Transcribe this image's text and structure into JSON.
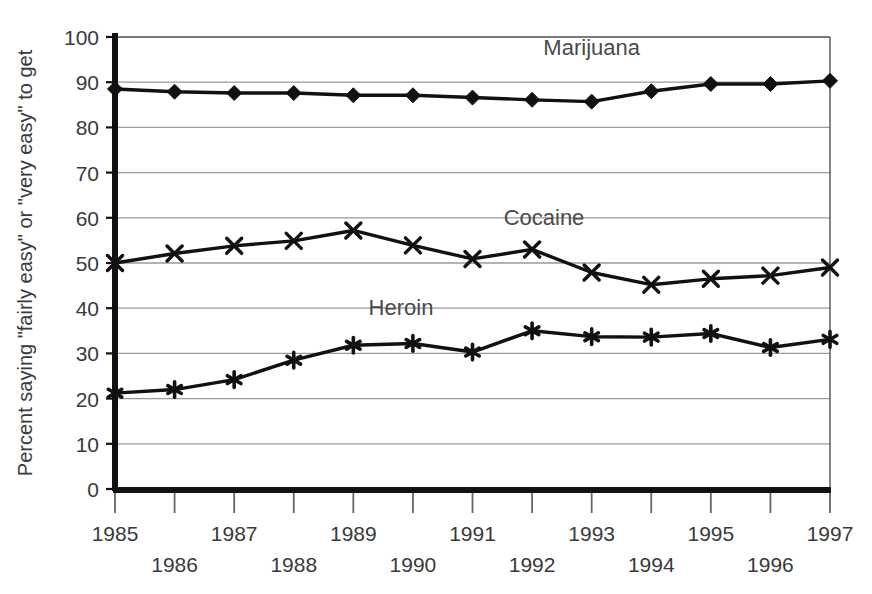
{
  "chart_data": {
    "type": "line",
    "title": "",
    "xlabel": "",
    "ylabel": "Percent saying \"fairly easy\" or \"very easy\" to get",
    "categories": [
      "1985",
      "1986",
      "1987",
      "1988",
      "1989",
      "1990",
      "1991",
      "1992",
      "1993",
      "1994",
      "1995",
      "1996",
      "1997"
    ],
    "x": [
      1985,
      1986,
      1987,
      1988,
      1989,
      1990,
      1991,
      1992,
      1993,
      1994,
      1995,
      1996,
      1997
    ],
    "xlim": [
      1985,
      1997
    ],
    "ylim": [
      0,
      100
    ],
    "ytick_values": [
      0,
      10,
      20,
      30,
      40,
      50,
      60,
      70,
      80,
      90,
      100
    ],
    "ytick_labels": [
      "0",
      "10",
      "20",
      "30",
      "40",
      "50",
      "60",
      "70",
      "80",
      "90",
      "100"
    ],
    "grid": true,
    "legend_position": "inline-annotations",
    "series": [
      {
        "name": "Marijuana",
        "marker": "diamond",
        "color": "#111111",
        "label_x": 1993.0,
        "label_y": 96.0,
        "values": [
          88.5,
          87.9,
          87.6,
          87.6,
          87.1,
          87.1,
          86.6,
          86.1,
          85.7,
          88.0,
          89.6,
          89.6,
          90.3
        ]
      },
      {
        "name": "Cocaine",
        "marker": "x",
        "color": "#111111",
        "label_x": 1992.2,
        "label_y": 58.5,
        "values": [
          50.0,
          52.1,
          53.8,
          54.9,
          57.2,
          53.9,
          50.9,
          53.0,
          47.9,
          45.2,
          46.5,
          47.2,
          49.0
        ]
      },
      {
        "name": "Heroin",
        "marker": "asterisk",
        "color": "#111111",
        "label_x": 1989.8,
        "label_y": 38.6,
        "values": [
          21.2,
          22.0,
          24.2,
          28.5,
          31.8,
          32.2,
          30.3,
          35.0,
          33.7,
          33.6,
          34.4,
          31.3,
          33.1
        ]
      }
    ]
  },
  "axes": {
    "frame_color": "#555555",
    "grid_color": "#9a9a9a",
    "spine_color": "#111111"
  }
}
